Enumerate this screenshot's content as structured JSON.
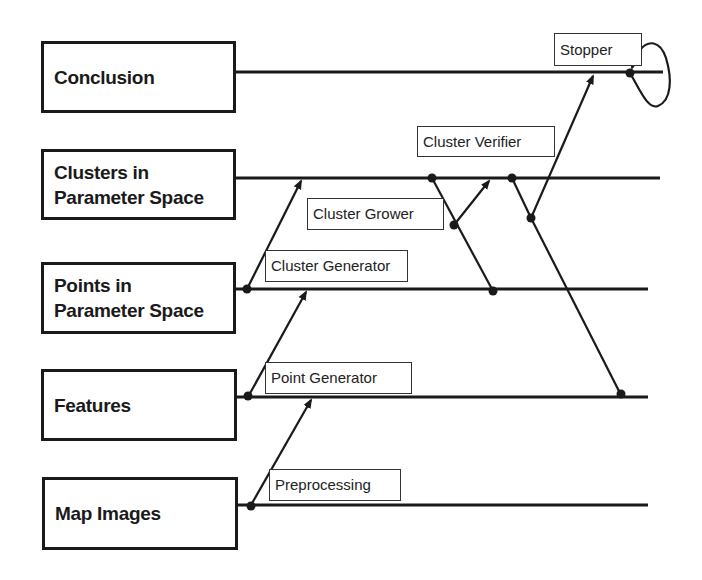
{
  "diagram": {
    "type": "layered agent-flow diagram",
    "levels": [
      {
        "id": "conclusion",
        "label_line1": "Conclusion",
        "label_line2": ""
      },
      {
        "id": "clusters",
        "label_line1": "Clusters in",
        "label_line2": "Parameter Space"
      },
      {
        "id": "points",
        "label_line1": "Points in",
        "label_line2": "Parameter Space"
      },
      {
        "id": "features",
        "label_line1": "Features",
        "label_line2": ""
      },
      {
        "id": "map-images",
        "label_line1": "Map Images",
        "label_line2": ""
      }
    ],
    "agents": [
      {
        "id": "stopper",
        "label": "Stopper",
        "from": "conclusion",
        "to": "conclusion"
      },
      {
        "id": "cluster-verifier",
        "label": "Cluster Verifier",
        "from": "clusters",
        "to": "conclusion"
      },
      {
        "id": "cluster-grower",
        "label": "Cluster Grower",
        "from": "clusters",
        "to": "clusters"
      },
      {
        "id": "cluster-generator",
        "label": "Cluster Generator",
        "from": "points",
        "to": "clusters"
      },
      {
        "id": "point-generator",
        "label": "Point Generator",
        "from": "features",
        "to": "points"
      },
      {
        "id": "preprocessing",
        "label": "Preprocessing",
        "from": "map-images",
        "to": "features"
      }
    ],
    "colors": {
      "ink": "#1a1a1a",
      "background": "#ffffff"
    }
  }
}
